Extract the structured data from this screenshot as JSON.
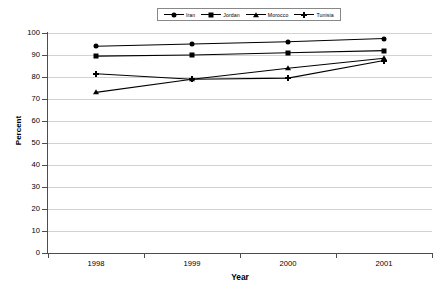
{
  "chart_data": {
    "type": "line",
    "title": "",
    "xlabel": "Year",
    "ylabel": "Percent",
    "categories": [
      "1998",
      "1999",
      "2000",
      "2001"
    ],
    "ylim": [
      0,
      100
    ],
    "ytick_step": 10,
    "yticks": [
      "100",
      "90",
      "80",
      "70",
      "60",
      "50",
      "40",
      "30",
      "20",
      "10",
      "0"
    ],
    "grid": "horizontal",
    "legend_position": "top-center",
    "series": [
      {
        "name": "Iran",
        "marker": "circle",
        "values": [
          94,
          95,
          96,
          97.5
        ]
      },
      {
        "name": "Jordan",
        "marker": "square",
        "values": [
          89.5,
          90,
          91,
          92
        ]
      },
      {
        "name": "Morocco",
        "marker": "triangle",
        "values": [
          73,
          79,
          84,
          88.5
        ]
      },
      {
        "name": "Tunisia",
        "marker": "cross",
        "values": [
          81.5,
          79,
          79.5,
          87.5
        ]
      }
    ],
    "line_color": "#000000",
    "grid_color": "#d2d2d2",
    "axis_color": "#4d4d4d"
  }
}
